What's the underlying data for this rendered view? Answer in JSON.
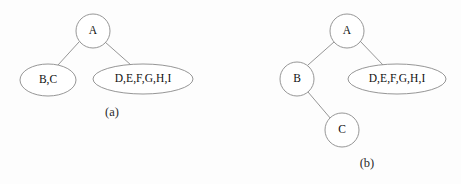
{
  "figure": {
    "background_color": "#fdfdfd",
    "stroke_color": "#8a8a8a",
    "text_color": "#101010",
    "panels": [
      {
        "id": "panel-a",
        "caption": "(a)",
        "caption_x": 112,
        "caption_y": 113,
        "nodes": [
          {
            "id": "a-root",
            "name": "node-a",
            "label": "A",
            "shape": "circle",
            "cx": 93,
            "cy": 31,
            "rx": 17,
            "ry": 17
          },
          {
            "id": "a-bc",
            "name": "node-bc",
            "label": "B,C",
            "shape": "ellipse",
            "cx": 48,
            "cy": 80,
            "rx": 28,
            "ry": 16
          },
          {
            "id": "a-defghi",
            "name": "node-defghi",
            "label": "D,E,F,G,H,I",
            "shape": "ellipse",
            "cx": 143,
            "cy": 79,
            "rx": 50,
            "ry": 15
          }
        ],
        "edges": [
          {
            "id": "a-edge-root-bc",
            "name": "edge-a-to-bc",
            "from": "a-root",
            "to": "a-bc",
            "x1": 79,
            "y1": 42,
            "x2": 58,
            "y2": 65
          },
          {
            "id": "a-edge-root-defghi",
            "name": "edge-a-to-defghi",
            "from": "a-root",
            "to": "a-defghi",
            "x1": 105,
            "y1": 42,
            "x2": 131,
            "y2": 65
          }
        ]
      },
      {
        "id": "panel-b",
        "caption": "(b)",
        "caption_x": 367,
        "caption_y": 164,
        "nodes": [
          {
            "id": "b-root",
            "name": "node-a",
            "label": "A",
            "shape": "circle",
            "cx": 347,
            "cy": 31,
            "rx": 17,
            "ry": 17
          },
          {
            "id": "b-b",
            "name": "node-b",
            "label": "B",
            "shape": "circle",
            "cx": 297,
            "cy": 79,
            "rx": 17,
            "ry": 17
          },
          {
            "id": "b-c",
            "name": "node-c",
            "label": "C",
            "shape": "circle",
            "cx": 342,
            "cy": 130,
            "rx": 17,
            "ry": 17
          },
          {
            "id": "b-defghi",
            "name": "node-defghi",
            "label": "D,E,F,G,H,I",
            "shape": "ellipse",
            "cx": 397,
            "cy": 79,
            "rx": 49,
            "ry": 15
          }
        ],
        "edges": [
          {
            "id": "b-edge-root-b",
            "name": "edge-a-to-b",
            "from": "b-root",
            "to": "b-b",
            "x1": 334,
            "y1": 42,
            "x2": 308,
            "y2": 65
          },
          {
            "id": "b-edge-root-defghi",
            "name": "edge-a-to-defghi",
            "from": "b-root",
            "to": "b-defghi",
            "x1": 360,
            "y1": 41,
            "x2": 384,
            "y2": 66
          },
          {
            "id": "b-edge-b-c",
            "name": "edge-b-to-c",
            "from": "b-b",
            "to": "b-c",
            "x1": 308,
            "y1": 92,
            "x2": 331,
            "y2": 119
          }
        ]
      }
    ]
  }
}
